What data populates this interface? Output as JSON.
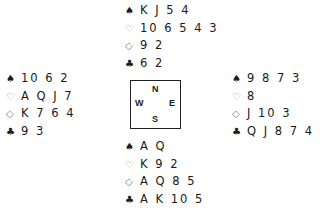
{
  "suit_symbols": {
    "spades": "♠",
    "hearts": "♡",
    "diamonds": "◇",
    "clubs": "♣"
  },
  "hands": {
    "north": {
      "spades": "K J 5 4",
      "hearts": "10 6 5 4 3",
      "diamonds": "9 2",
      "clubs": "6 2"
    },
    "west": {
      "spades": "10 6 2",
      "hearts": "A Q J 7",
      "diamonds": "K 7 6 4",
      "clubs": "9 3"
    },
    "east": {
      "spades": "9 8 7 3",
      "hearts": "8",
      "diamonds": "J 10 3",
      "clubs": "Q J 8 7 4"
    },
    "south": {
      "spades": "A Q",
      "hearts": "K 9 2",
      "diamonds": "A Q 8 5",
      "clubs": "A K 10 5"
    }
  },
  "compass": {
    "north": "N",
    "south": "S",
    "west": "W",
    "east": "E"
  }
}
